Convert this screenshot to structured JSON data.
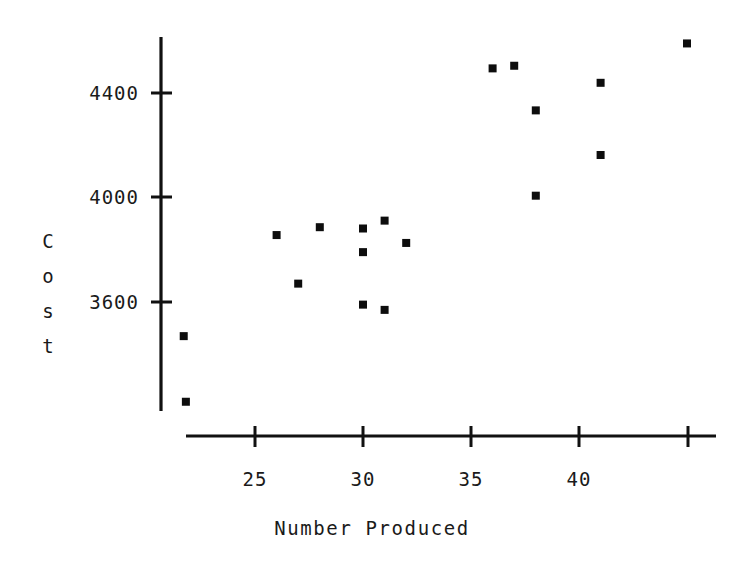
{
  "chart_data": {
    "type": "scatter",
    "title": "",
    "xlabel": "Number Produced",
    "ylabel": "Cost",
    "xlim": [
      21,
      45.6
    ],
    "ylim": [
      3150,
      4650
    ],
    "grid": false,
    "legend": null,
    "xticks": [
      25,
      30,
      35,
      40,
      45
    ],
    "xtick_labels": [
      "25",
      "30",
      "35",
      "40",
      ""
    ],
    "yticks": [
      3600,
      4000,
      4400
    ],
    "ytick_labels": [
      "3600",
      "4000",
      "4400"
    ],
    "marker": "square",
    "marker_color": "#0d0d0d",
    "points": [
      {
        "x": 21.7,
        "y": 3470
      },
      {
        "x": 21.8,
        "y": 3220
      },
      {
        "x": 26.0,
        "y": 3855
      },
      {
        "x": 27.0,
        "y": 3670
      },
      {
        "x": 28.0,
        "y": 3885
      },
      {
        "x": 30.0,
        "y": 3880
      },
      {
        "x": 30.0,
        "y": 3790
      },
      {
        "x": 30.0,
        "y": 3590
      },
      {
        "x": 31.0,
        "y": 3910
      },
      {
        "x": 31.0,
        "y": 3570
      },
      {
        "x": 32.0,
        "y": 3825
      },
      {
        "x": 36.0,
        "y": 4490
      },
      {
        "x": 37.0,
        "y": 4500
      },
      {
        "x": 38.0,
        "y": 4330
      },
      {
        "x": 38.0,
        "y": 4005
      },
      {
        "x": 41.0,
        "y": 4435
      },
      {
        "x": 41.0,
        "y": 4160
      },
      {
        "x": 45.0,
        "y": 4585
      }
    ]
  },
  "axes": {
    "x_title": "Number Produced",
    "y_title_chars": [
      "C",
      "o",
      "s",
      "t"
    ],
    "x_tick_labels": [
      "25",
      "30",
      "35",
      "40"
    ],
    "y_tick_labels": [
      "4400",
      "4000",
      "3600"
    ]
  }
}
